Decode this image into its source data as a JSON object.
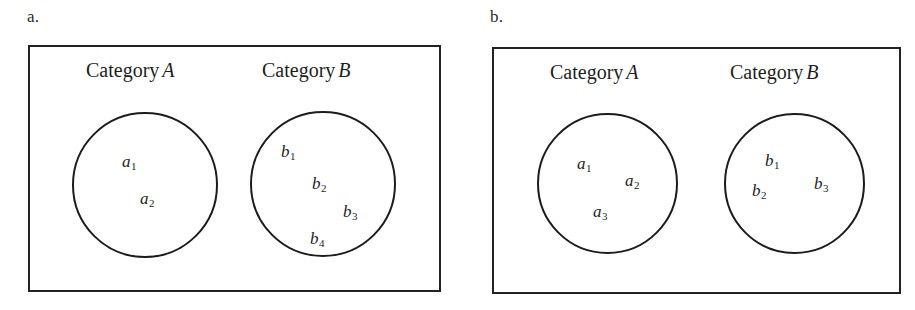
{
  "figure": {
    "background_color": "#ffffff",
    "line_color": "#1c1c1c",
    "text_color": "#1e1e1e"
  },
  "panels": [
    {
      "letter": "a.",
      "categories": [
        {
          "prefix": "Category",
          "letter": "A"
        },
        {
          "prefix": "Category",
          "letter": "B"
        }
      ],
      "sets": [
        {
          "set_label": "A",
          "members": [
            {
              "symbol": "a",
              "subscript": "1",
              "text": "a1"
            },
            {
              "symbol": "a",
              "subscript": "2",
              "text": "a2"
            }
          ]
        },
        {
          "set_label": "B",
          "members": [
            {
              "symbol": "b",
              "subscript": "1",
              "text": "b1"
            },
            {
              "symbol": "b",
              "subscript": "2",
              "text": "b2"
            },
            {
              "symbol": "b",
              "subscript": "3",
              "text": "b3"
            },
            {
              "symbol": "b",
              "subscript": "4",
              "text": "b4"
            }
          ]
        }
      ]
    },
    {
      "letter": "b.",
      "categories": [
        {
          "prefix": "Category",
          "letter": "A"
        },
        {
          "prefix": "Category",
          "letter": "B"
        }
      ],
      "sets": [
        {
          "set_label": "A",
          "members": [
            {
              "symbol": "a",
              "subscript": "1",
              "text": "a1"
            },
            {
              "symbol": "a",
              "subscript": "2",
              "text": "a2"
            },
            {
              "symbol": "a",
              "subscript": "3",
              "text": "a3"
            }
          ]
        },
        {
          "set_label": "B",
          "members": [
            {
              "symbol": "b",
              "subscript": "1",
              "text": "b1"
            },
            {
              "symbol": "b",
              "subscript": "2",
              "text": "b2"
            },
            {
              "symbol": "b",
              "subscript": "3",
              "text": "b3"
            }
          ]
        }
      ]
    }
  ]
}
